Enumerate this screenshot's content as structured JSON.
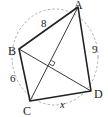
{
  "diagram": {
    "type": "cyclic-quadrilateral",
    "vertices": {
      "A": {
        "label": "A",
        "x": 78,
        "y": 7
      },
      "B": {
        "label": "B",
        "x": 19,
        "y": 49
      },
      "C": {
        "label": "C",
        "x": 30,
        "y": 101
      },
      "D": {
        "label": "D",
        "x": 91,
        "y": 91
      }
    },
    "sides": {
      "AB": {
        "label": "8"
      },
      "BC": {
        "label": "6"
      },
      "AD": {
        "label": "9"
      },
      "CD": {
        "label": "x"
      }
    },
    "diagonals_perpendicular": true,
    "circle": {
      "style": "dashed",
      "color": "#999999"
    },
    "colors": {
      "edge": "#222222",
      "circle": "#999999"
    }
  }
}
